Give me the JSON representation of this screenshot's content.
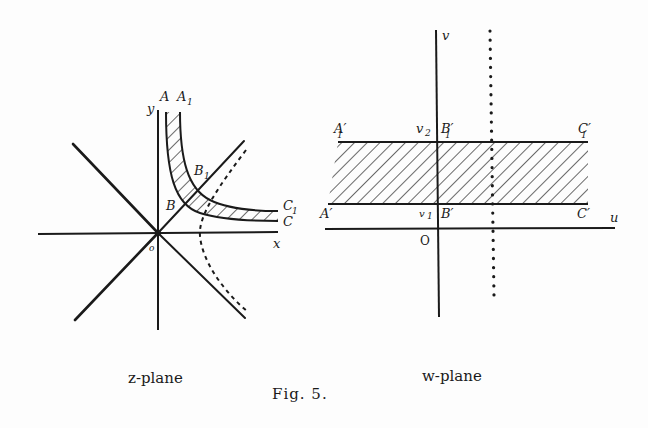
{
  "figure": {
    "caption": "Fig. 5.",
    "z_plane": {
      "title": "z-plane",
      "axis_labels": {
        "x": "x",
        "y": "y"
      },
      "origin_label": "o",
      "point_labels": {
        "A": "A",
        "A1": "A",
        "A1_sub": "1",
        "B": "B",
        "B1": "B",
        "B1_sub": "1",
        "C": "C",
        "C1": "C",
        "C1_sub": "1"
      }
    },
    "w_plane": {
      "title": "w-plane",
      "axis_labels": {
        "u": "u",
        "v": "v"
      },
      "origin_label": "O",
      "level_labels": {
        "v1": "v",
        "v1_sub": "1",
        "v2": "v",
        "v2_sub": "2"
      },
      "point_labels": {
        "A_prime": "A′",
        "B_prime": "B′",
        "C_prime": "C′",
        "A1_prime": "A′",
        "A1_prime_sub": "1",
        "B1_prime": "B′",
        "B1_prime_sub": "1",
        "C1_prime": "C′",
        "C1_prime_sub": "1"
      }
    },
    "colors": {
      "ink": "#1a1a1a",
      "paper": "#fdfdfd"
    }
  }
}
